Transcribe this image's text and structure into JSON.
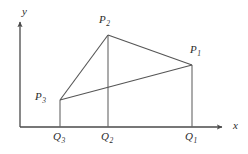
{
  "figure": {
    "background_color": "#ffffff",
    "stroke_color": "#555555",
    "axis_color": "#4a4a4a",
    "text_color": "#2b2b2b"
  },
  "axes": {
    "x_label": "x",
    "y_label": "y",
    "origin": {
      "x": 20,
      "y": 127
    },
    "x_axis_end": {
      "x": 227,
      "y": 127
    },
    "y_axis_end": {
      "x": 20,
      "y": 17
    }
  },
  "points": [
    {
      "id": "P1",
      "letter": "P",
      "subscript": "1",
      "label": "P₁",
      "x": 192,
      "y": 65,
      "label_x": 190,
      "label_y": 46
    },
    {
      "id": "P2",
      "letter": "P",
      "subscript": "2",
      "label": "P₂",
      "x": 108,
      "y": 35,
      "label_x": 99,
      "label_y": 16
    },
    {
      "id": "P3",
      "letter": "P",
      "subscript": "3",
      "label": "P₃",
      "x": 60,
      "y": 100,
      "label_x": 35,
      "label_y": 92
    }
  ],
  "foot_points": [
    {
      "id": "Q1",
      "letter": "Q",
      "subscript": "1",
      "label": "Q₁",
      "x": 192,
      "y": 127,
      "label_x": 185,
      "label_y": 132
    },
    {
      "id": "Q2",
      "letter": "Q",
      "subscript": "2",
      "label": "Q₂",
      "x": 108,
      "y": 127,
      "label_x": 101,
      "label_y": 132
    },
    {
      "id": "Q3",
      "letter": "Q",
      "subscript": "3",
      "label": "Q₃",
      "x": 60,
      "y": 127,
      "label_x": 53,
      "label_y": 132
    }
  ],
  "segments": [
    {
      "id": "P3-P2",
      "from": "P3",
      "to": "P2",
      "x1": 60,
      "y1": 100,
      "x2": 108,
      "y2": 35
    },
    {
      "id": "P2-P1",
      "from": "P2",
      "to": "P1",
      "x1": 108,
      "y1": 35,
      "x2": 192,
      "y2": 65
    },
    {
      "id": "P3-P1",
      "from": "P3",
      "to": "P1",
      "x1": 60,
      "y1": 100,
      "x2": 192,
      "y2": 65
    }
  ],
  "ordinates": [
    {
      "id": "P1-Q1",
      "x": 192,
      "y_top": 65,
      "y_bottom": 127
    },
    {
      "id": "P2-Q2",
      "x": 108,
      "y_top": 35,
      "y_bottom": 127
    },
    {
      "id": "P3-Q3",
      "x": 60,
      "y_top": 100,
      "y_bottom": 127
    }
  ]
}
